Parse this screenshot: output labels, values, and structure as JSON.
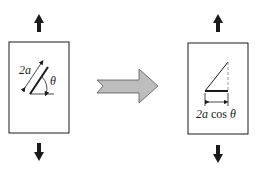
{
  "left_panel": {
    "crack_length_label": "2a",
    "angle_label": "θ"
  },
  "right_panel": {
    "projected_length_label_prefix": "2a",
    "projected_length_label_func": " cos ",
    "projected_length_label_angle": "θ"
  },
  "colors": {
    "stroke": "#1a1a1a",
    "arrow_fill": "#b8b8b8",
    "arrow_stroke": "#555555"
  }
}
